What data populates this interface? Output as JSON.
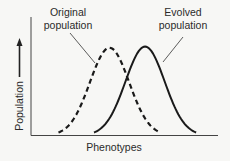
{
  "chart_data": {
    "type": "line",
    "title": "",
    "xlabel": "Phenotypes",
    "ylabel": "Population",
    "ylabel_arrow": "up-arrow",
    "xlim": [
      0,
      1
    ],
    "ylim": [
      0,
      1
    ],
    "grid": false,
    "series": [
      {
        "name": "Original population",
        "label_lines": [
          "Original",
          "population"
        ],
        "style": "dashed",
        "color": "#1a1a1a",
        "mean": 0.42,
        "sd": 0.105,
        "peak": 0.74
      },
      {
        "name": "Evolved population",
        "label_lines": [
          "Evolved",
          "population"
        ],
        "style": "solid",
        "color": "#1a1a1a",
        "mean": 0.61,
        "sd": 0.105,
        "peak": 0.75
      }
    ]
  }
}
